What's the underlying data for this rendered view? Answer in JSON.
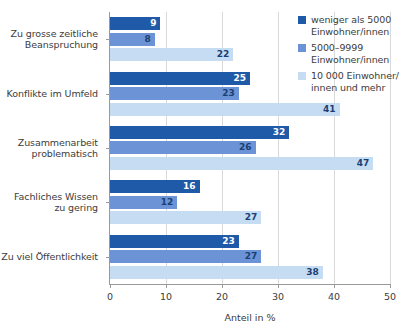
{
  "chart_data": {
    "type": "bar",
    "orientation": "horizontal",
    "title": "",
    "xlabel": "Anteil in %",
    "ylabel": "",
    "xlim": [
      0,
      50
    ],
    "xticks": [
      0,
      10,
      20,
      30,
      40,
      50
    ],
    "xtick_labels": [
      "0",
      "10",
      "20",
      "30",
      "40",
      "50"
    ],
    "grid": true,
    "legend_position": "top-right",
    "categories": [
      "Zu grosse zeitliche Beanspruchung",
      "Konflikte im Umfeld",
      "Zusammenarbeit problematisch",
      "Fachliches Wissen zu gering",
      "Zu viel Öffentlichkeit"
    ],
    "category_lines": [
      [
        "Zu grosse zeitliche",
        "Beanspruchung"
      ],
      [
        "Konflikte im Umfeld"
      ],
      [
        "Zusammenarbeit",
        "problematisch"
      ],
      [
        "Fachliches Wissen",
        "zu gering"
      ],
      [
        "Zu viel Öffentlichkeit"
      ]
    ],
    "series": [
      {
        "name": "weniger als 5000 Einwohner/innen",
        "color": "#1f5aa8",
        "values": [
          9,
          25,
          32,
          16,
          23
        ]
      },
      {
        "name": "5000–9999 Einwohner/innen",
        "color": "#6b93d6",
        "values": [
          8,
          23,
          26,
          12,
          27
        ]
      },
      {
        "name": "10 000 Einwohner/innen und mehr",
        "color": "#c5dcf2",
        "values": [
          22,
          41,
          47,
          27,
          38
        ]
      }
    ]
  },
  "legend": {
    "items": [
      {
        "color": "#1f5aa8",
        "line1": "weniger als 5000",
        "line2": "Einwohner/innen"
      },
      {
        "color": "#6b93d6",
        "line1": "5000–9999",
        "line2": "Einwohner/innen"
      },
      {
        "color": "#c5dcf2",
        "line1": "10 000 Einwohner/",
        "line2": "innen und mehr"
      }
    ]
  },
  "axis": {
    "x_title": "Anteil in %",
    "tick_labels": [
      "0",
      "10",
      "20",
      "30",
      "40",
      "50"
    ]
  }
}
